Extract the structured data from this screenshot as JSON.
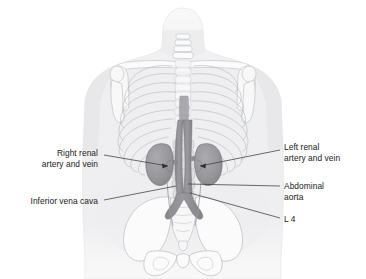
{
  "figure": {
    "background_color": "#ffffff",
    "text_color": "#1a1a1a",
    "leader_line_color": "#3c3c3c"
  },
  "labels": {
    "right_renal_line1": "Right renal",
    "right_renal_line2": "artery and vein",
    "inferior_vena_cava": "Inferior vena cava",
    "left_renal_line1": "Left renal",
    "left_renal_line2": "artery and vein",
    "abdominal_aorta_line1": "Abdominal",
    "abdominal_aorta_line2": "aorta",
    "l4": "L 4"
  },
  "anatomy_colors": {
    "body_silhouette": "#f0f0f1",
    "skeleton_outline": "#b9bcc0",
    "skeleton_fill": "#fafafa",
    "kidney_fill": "#9a9a9e",
    "kidney_outline": "#78787c",
    "vessel_fill": "#8f8f94",
    "vessel_outline": "#76767b",
    "vertebra_fill": "#d8d8da"
  },
  "structures": [
    "head-and-neck",
    "clavicles",
    "scapulae",
    "humerus-heads",
    "ribcage",
    "sternum",
    "vertebral-column",
    "left-kidney",
    "right-kidney",
    "abdominal-aorta",
    "inferior-vena-cava",
    "common-iliac-arteries",
    "pelvis",
    "sacrum"
  ]
}
